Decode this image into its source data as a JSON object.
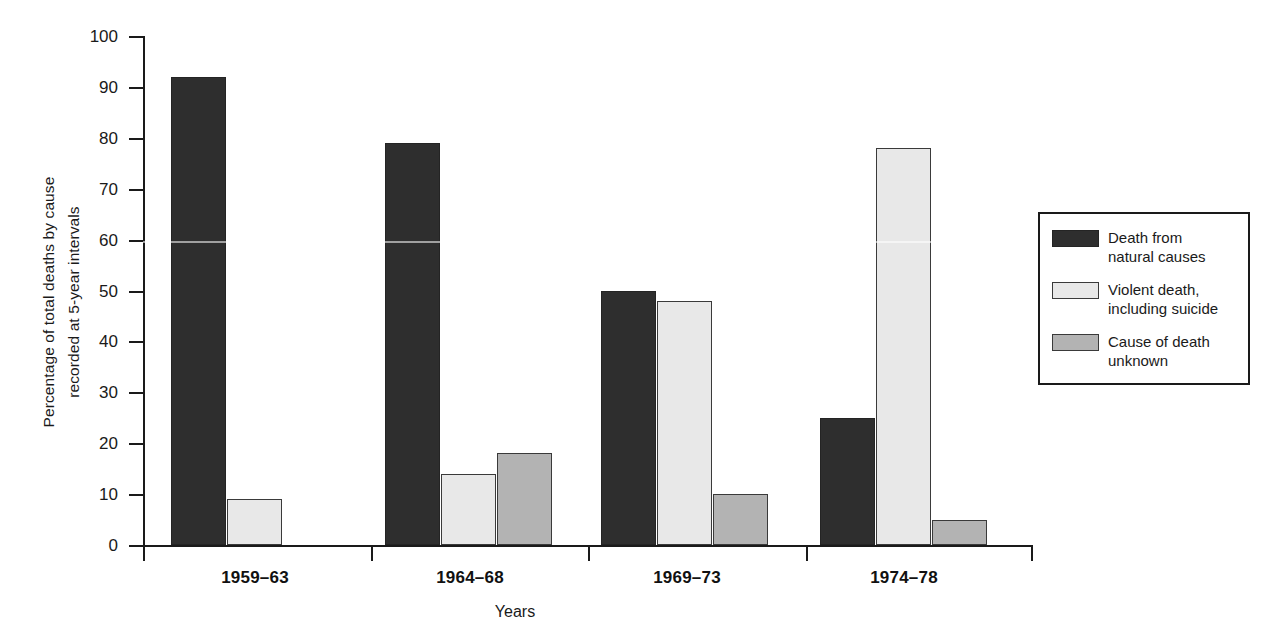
{
  "chart_data": {
    "type": "bar",
    "title": "",
    "xlabel": "Years",
    "ylabel": "Percentage of total deaths by cause\nrecorded at 5-year intervals",
    "categories": [
      "1959–63",
      "1964–68",
      "1969–73",
      "1974–78"
    ],
    "series": [
      {
        "name": "Death from\nnatural causes",
        "key": "natural",
        "color": "#2e2e2e",
        "values": [
          92,
          79,
          50,
          25
        ]
      },
      {
        "name": "Violent death,\nincluding suicide",
        "key": "violent",
        "color": "#e8e8e8",
        "values": [
          9,
          14,
          48,
          78
        ]
      },
      {
        "name": "Cause of death\nunknown",
        "key": "unknown",
        "color": "#b3b3b3",
        "values": [
          null,
          18,
          10,
          5
        ]
      }
    ],
    "ylim": [
      0,
      100
    ],
    "ytick_values": [
      0,
      10,
      20,
      30,
      40,
      50,
      60,
      70,
      80,
      90,
      100
    ],
    "ytick_labels": [
      "0",
      "10",
      "20",
      "30",
      "40",
      "50",
      "60",
      "70",
      "80",
      "90",
      "100"
    ],
    "grid": false,
    "legend_position": "right"
  },
  "axis": {
    "y_title": "Percentage of total deaths by cause\nrecorded at 5-year intervals",
    "x_title": "Years"
  },
  "legend": {
    "items": [
      {
        "label": "Death from\nnatural causes",
        "swatch": "dark"
      },
      {
        "label": "Violent death,\nincluding suicide",
        "swatch": "light"
      },
      {
        "label": "Cause of death\nunknown",
        "swatch": "gray"
      }
    ]
  }
}
